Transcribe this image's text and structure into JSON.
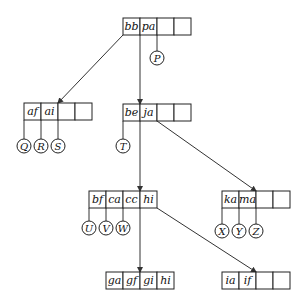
{
  "diagram": {
    "type": "b-tree",
    "cell_width": 17,
    "cell_height": 17,
    "nodes": [
      {
        "id": "root",
        "x": 123,
        "y": 18,
        "keys": [
          "bb",
          "pa",
          "",
          ""
        ]
      },
      {
        "id": "n_af",
        "x": 24,
        "y": 103,
        "keys": [
          "af",
          "ai",
          "",
          ""
        ]
      },
      {
        "id": "n_be",
        "x": 123,
        "y": 104,
        "keys": [
          "be",
          "ja",
          "",
          ""
        ]
      },
      {
        "id": "n_bf",
        "x": 89,
        "y": 191,
        "keys": [
          "bf",
          "ca",
          "cc",
          "hi"
        ]
      },
      {
        "id": "n_ka",
        "x": 222,
        "y": 191,
        "keys": [
          "ka",
          "ma",
          "",
          ""
        ]
      },
      {
        "id": "n_ga",
        "x": 106,
        "y": 272,
        "keys": [
          "ga",
          "gf",
          "gi",
          "hi"
        ]
      },
      {
        "id": "n_ia",
        "x": 222,
        "y": 272,
        "keys": [
          "ia",
          "if",
          "",
          ""
        ]
      }
    ],
    "edges": [
      {
        "from": "root",
        "x1": 123,
        "y1": 35,
        "x2": 58,
        "y2": 103
      },
      {
        "from": "root",
        "x1": 140,
        "y1": 35,
        "x2": 140,
        "y2": 104
      },
      {
        "from": "n_be",
        "x1": 140,
        "y1": 121,
        "x2": 140,
        "y2": 191
      },
      {
        "from": "n_be",
        "x1": 157,
        "y1": 121,
        "x2": 256,
        "y2": 191
      },
      {
        "from": "n_bf",
        "x1": 140,
        "y1": 208,
        "x2": 140,
        "y2": 272
      },
      {
        "from": "n_bf",
        "x1": 157,
        "y1": 208,
        "x2": 256,
        "y2": 272
      }
    ],
    "leaves": [
      {
        "label": "P",
        "stem_x": 157,
        "stem_y1": 35,
        "cx": 157,
        "cy": 58
      },
      {
        "label": "Q",
        "stem_x": 24,
        "stem_y1": 120,
        "cx": 24,
        "cy": 146
      },
      {
        "label": "R",
        "stem_x": 41,
        "stem_y1": 120,
        "cx": 41,
        "cy": 146
      },
      {
        "label": "S",
        "stem_x": 58,
        "stem_y1": 120,
        "cx": 58,
        "cy": 146
      },
      {
        "label": "T",
        "stem_x": 123,
        "stem_y1": 121,
        "cx": 123,
        "cy": 146
      },
      {
        "label": "U",
        "stem_x": 89,
        "stem_y1": 208,
        "cx": 89,
        "cy": 228
      },
      {
        "label": "V",
        "stem_x": 106,
        "stem_y1": 208,
        "cx": 106,
        "cy": 228
      },
      {
        "label": "W",
        "stem_x": 123,
        "stem_y1": 208,
        "cx": 123,
        "cy": 228
      },
      {
        "label": "X",
        "stem_x": 222,
        "stem_y1": 208,
        "cx": 222,
        "cy": 231
      },
      {
        "label": "Y",
        "stem_x": 239,
        "stem_y1": 208,
        "cx": 239,
        "cy": 231
      },
      {
        "label": "Z",
        "stem_x": 256,
        "stem_y1": 208,
        "cx": 256,
        "cy": 231
      }
    ],
    "leaf_radius": 7,
    "colors": {
      "stroke": "#222222",
      "background": "#ffffff"
    }
  }
}
